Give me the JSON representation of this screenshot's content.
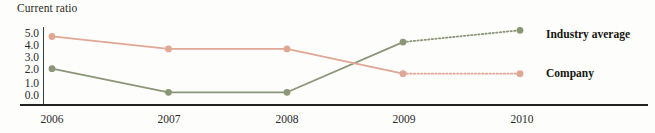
{
  "chart_data": {
    "type": "line",
    "title": "Current ratio",
    "xlabel": "",
    "ylabel": "",
    "categories": [
      "2006",
      "2007",
      "2008",
      "2009",
      "2010"
    ],
    "ylim": [
      0.0,
      5.0
    ],
    "ytick_labels": [
      "5.0",
      "4.0",
      "3.0",
      "2.0",
      "1.0",
      "0.0"
    ],
    "ytick_values": [
      5.0,
      4.0,
      3.0,
      2.0,
      1.0,
      0.0
    ],
    "grid": false,
    "legend_position": "right",
    "series": [
      {
        "name": "Industry average",
        "color": "#8b9677",
        "values": [
          2.2,
          0.3,
          0.3,
          4.35,
          5.3
        ],
        "dashed_from_index": 3,
        "legend_label": "Industry average"
      },
      {
        "name": "Company",
        "color": "#e0a795",
        "values": [
          4.8,
          3.8,
          3.8,
          1.8,
          1.8
        ],
        "dashed_from_index": 3,
        "legend_label": "Company"
      }
    ],
    "axis_color": "#23231f"
  },
  "legend": {
    "industry_average_label": "Industry average",
    "company_label": "Company"
  }
}
